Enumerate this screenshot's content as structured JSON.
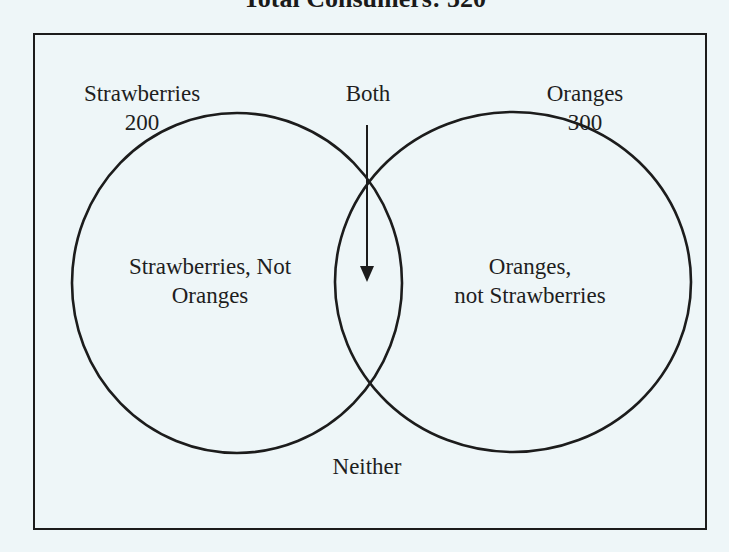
{
  "title": "Total Consumers: 520",
  "sets": {
    "left": {
      "name": "Strawberries",
      "count": "200",
      "region_label_line1": "Strawberries, Not",
      "region_label_line2": "Oranges"
    },
    "right": {
      "name": "Oranges",
      "count": "300",
      "region_label_line1": "Oranges,",
      "region_label_line2": "not Strawberries"
    },
    "intersection": {
      "label": "Both"
    },
    "outside": {
      "label": "Neither"
    }
  },
  "colors": {
    "background": "#eef6f8",
    "stroke": "#1c1c1c",
    "text": "#1e1e1e"
  },
  "icons": {
    "both_pointer": "down-arrow"
  }
}
